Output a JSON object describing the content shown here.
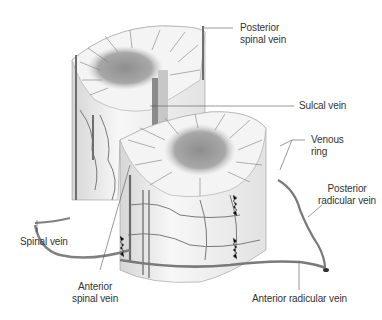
{
  "figure": {
    "colors": {
      "background": "#ffffff",
      "cord_surface": "#f2f2f2",
      "cord_shadow": "#cfcfcf",
      "gray_matter": "#9a9a9a",
      "vein": "#7d7d7d",
      "vein_dark": "#555555",
      "leader_line": "#555555",
      "label_text": "#333333"
    },
    "labels": {
      "posterior_spinal_vein": "Posterior\nspinal vein",
      "sulcal_vein": "Sulcal vein",
      "venous_ring": "Venous\nring",
      "posterior_radicular_vein": "Posterior\nradicular vein",
      "spinal_vein": "Spinal vein",
      "anterior_spinal_vein": "Anterior\nspinal vein",
      "anterior_radicular_vein": "Anterior radicular vein"
    }
  }
}
